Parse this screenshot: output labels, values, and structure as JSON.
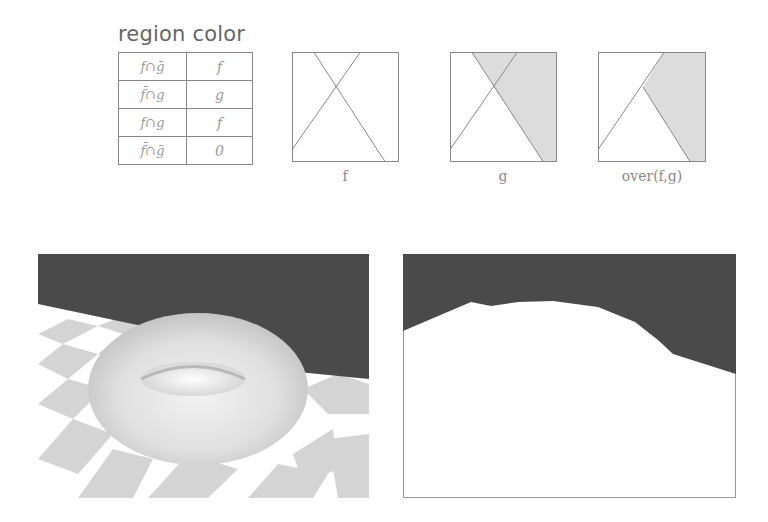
{
  "table": {
    "title": "region color",
    "rows": [
      {
        "region": "f∩ḡ",
        "color": "f"
      },
      {
        "region": "f̄∩g",
        "color": "g"
      },
      {
        "region": "f∩g",
        "color": "f"
      },
      {
        "region": "f̄∩ḡ",
        "color": "0"
      }
    ]
  },
  "panels": {
    "f": {
      "caption": "f"
    },
    "g": {
      "caption": "g"
    },
    "over": {
      "caption": "over(f,g)"
    }
  },
  "images": {
    "left": {
      "description": "torus on checkerboard floor"
    },
    "right": {
      "description": "coverage mask of foreground"
    }
  },
  "colors": {
    "dark_bg": "#4a4a4a",
    "shade": "#dcdcdc",
    "checker": "#d4d4d4",
    "line": "#888888"
  }
}
